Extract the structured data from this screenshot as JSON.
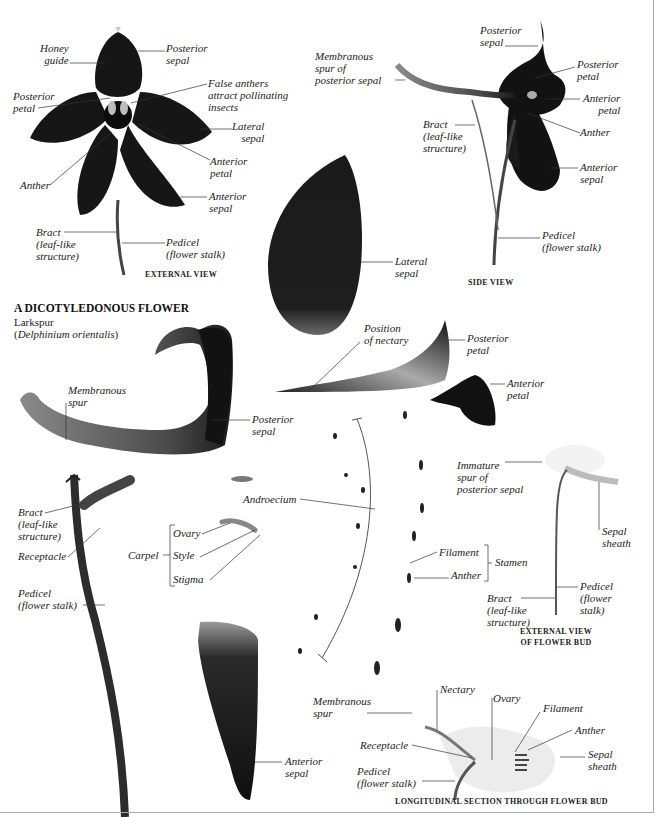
{
  "title": {
    "heading": "A DICOTYLEDONOUS FLOWER",
    "common_name": "Larkspur",
    "species_open": "(",
    "species": "Delphinium orientalis",
    "species_close": ")"
  },
  "external_view": {
    "caption": "EXTERNAL VIEW",
    "labels": {
      "honey_guide": "Honey\nguide",
      "posterior_sepal": "Posterior\nsepal",
      "false_anthers": "False anthers\nattract pollinating\ninsects",
      "posterior_petal": "Posterior\npetal",
      "lateral_sepal": "Lateral\nsepal",
      "anterior_petal": "Anterior\npetal",
      "anther": "Anther",
      "anterior_sepal": "Anterior\nsepal",
      "bract": "Bract\n(leaf-like\nstructure)",
      "pedicel": "Pedicel\n(flower stalk)"
    }
  },
  "side_view": {
    "caption": "SIDE VIEW",
    "labels": {
      "posterior_sepal": "Posterior\nsepal",
      "membranous_spur": "Membranous\nspur of\nposterior sepal",
      "posterior_petal": "Posterior\npetal",
      "anterior_petal": "Anterior\npetal",
      "bract": "Bract\n(leaf-like\nstructure)",
      "anther": "Anther",
      "anterior_sepal": "Anterior\nsepal",
      "pedicel": "Pedicel\n(flower stalk)"
    }
  },
  "dissection": {
    "lateral_sepal": "Lateral\nsepal",
    "position_of_nectary": "Position\nof nectary",
    "posterior_petal": "Posterior\npetal",
    "anterior_petal": "Anterior\npetal",
    "membranous_spur": "Membranous\nspur",
    "posterior_sepal": "Posterior\nsepal",
    "androecium": "Androecium",
    "bract": "Bract\n(leaf-like\nstructure)",
    "receptacle": "Receptacle",
    "carpel": "Carpel",
    "ovary": "Ovary",
    "style": "Style",
    "stigma": "Stigma",
    "pedicel": "Pedicel\n(flower stalk)",
    "filament": "Filament",
    "anther": "Anther",
    "stamen": "Stamen",
    "anterior_sepal": "Anterior\nsepal"
  },
  "flower_bud": {
    "caption": "EXTERNAL VIEW\nOF FLOWER BUD",
    "labels": {
      "immature_spur": "Immature\nspur of\nposterior sepal",
      "sepal_sheath": "Sepal\nsheath",
      "pedicel": "Pedicel\n(flower\nstalk)",
      "bract": "Bract\n(leaf-like\nstructure)"
    }
  },
  "longitudinal_section": {
    "caption": "LONGITUDINAL SECTION THROUGH FLOWER BUD",
    "labels": {
      "membranous_spur": "Membranous\nspur",
      "nectary": "Nectary",
      "ovary": "Ovary",
      "filament": "Filament",
      "anther": "Anther",
      "receptacle": "Receptacle",
      "sepal_sheath": "Sepal\nsheath",
      "pedicel": "Pedicel\n(flower stalk)"
    }
  },
  "colors": {
    "petal_dark": "#141414",
    "stalk": "#3a3a3a",
    "leader_line": "#333333",
    "border": "#aaaaaa"
  }
}
